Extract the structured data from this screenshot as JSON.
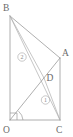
{
  "figure": {
    "width": 73,
    "height": 137,
    "background_color": "#ffffff",
    "line_color": "#9a9a9a",
    "label_color": "#6b6b6b",
    "badge_color": "#8a8a8a"
  },
  "vertices": {
    "B": {
      "label": "B",
      "x": 10,
      "y": 16,
      "label_x": 3,
      "label_y": 11
    },
    "A": {
      "label": "A",
      "x": 60,
      "y": 58,
      "label_x": 62,
      "label_y": 56
    },
    "D": {
      "label": "D",
      "x": 44,
      "y": 78,
      "label_x": 46.5,
      "label_y": 81
    },
    "O": {
      "label": "O",
      "x": 10,
      "y": 120,
      "label_x": 3,
      "label_y": 133
    },
    "C": {
      "label": "C",
      "x": 60,
      "y": 120,
      "label_x": 57,
      "label_y": 133
    }
  },
  "segments": [
    {
      "name": "segment-BO",
      "from": "B",
      "to": "O"
    },
    {
      "name": "segment-OC",
      "from": "O",
      "to": "C"
    },
    {
      "name": "segment-AC",
      "from": "A",
      "to": "C"
    },
    {
      "name": "segment-BA",
      "from": "B",
      "to": "A"
    },
    {
      "name": "segment-BC",
      "from": "B",
      "to": "C"
    },
    {
      "name": "segment-BD",
      "from": "B",
      "to": "D"
    },
    {
      "name": "segment-OA",
      "from": "O",
      "to": "A"
    },
    {
      "name": "segment-DC",
      "from": "D",
      "to": "C"
    }
  ],
  "angle_badges": [
    {
      "name": "angle-badge-2",
      "label": "2",
      "x": 22,
      "y": 57,
      "radius": 4.2
    },
    {
      "name": "angle-badge-1",
      "label": "1",
      "x": 45.5,
      "y": 100,
      "radius": 4.2
    }
  ],
  "angle_marks": [
    {
      "name": "right-angle-mark-at-O",
      "vertex": "O",
      "type": "right-angle",
      "size": 7
    },
    {
      "name": "angle-arc-at-O",
      "vertex": "O",
      "type": "arc",
      "radius": 13
    }
  ]
}
